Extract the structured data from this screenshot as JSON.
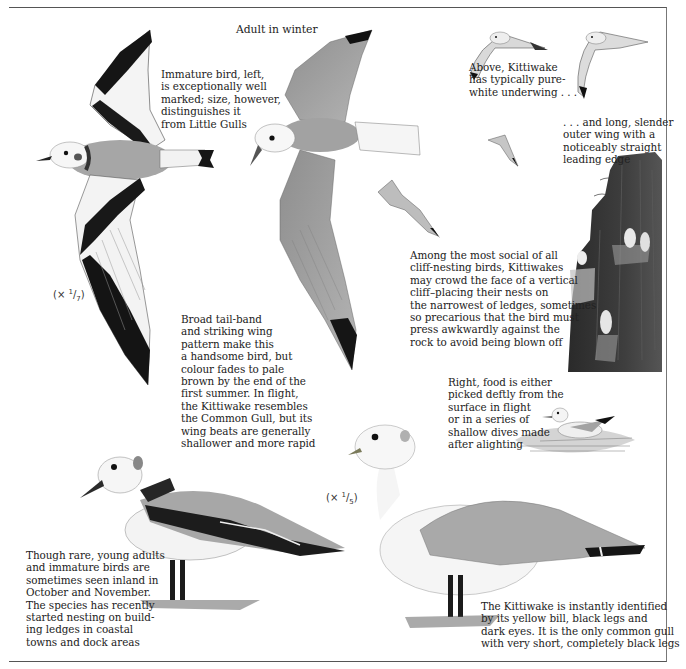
{
  "page": {
    "subject": "Kittiwake",
    "heading": "Adult in winter"
  },
  "captions": {
    "immature": "Immature bird, left,\nis exceptionally well\nmarked; size, however,\ndistinguishes it\nfrom Little Gulls",
    "underwing": "Above, Kittiwake\nhas typically pure-\nwhite underwing . . .",
    "outer_wing": ". . . and long, slender\nouter wing with a\nnoticeably straight\nleading edge",
    "cliff_nesting": "Among the most social of all\ncliff-nesting birds, Kittiwakes\nmay crowd the face of a vertical\ncliff–placing their nests on\nthe narrowest of ledges, sometimes\nso precarious that the bird must\npress awkwardly against the\nrock to avoid being blown off",
    "tail_band": "Broad tail-band\nand striking wing\npattern make this\na handsome bird, but\ncolour fades to pale\nbrown by the end of the\nfirst summer. In flight,\nthe Kittiwake resembles\nthe Common Gull, but its\nwing beats are generally\nshallower and more rapid",
    "feeding": "Right, food is either\npicked deftly from the\nsurface in flight\nor in a series of\nshallow dives made\nafter alighting",
    "young_adults": "Though rare, young adults\nand immature birds are\nsometimes seen inland in\nOctober and November.\nThe species has recently\nstarted nesting on build-\ning ledges in coastal\ntowns and dock areas",
    "identification": "The Kittiwake is instantly identified\nby its yellow bill, black legs and\ndark eyes. It is the only common gull\nwith very short, completely black legs"
  },
  "scales": {
    "flight_scale": {
      "prefix": "(× ",
      "num": "1",
      "den": "7",
      "suffix": ")"
    },
    "standing_scale": {
      "prefix": "(× ",
      "num": "1",
      "den": "5",
      "suffix": ")"
    }
  },
  "illustrations": [
    {
      "name": "immature-kittiwake-in-flight",
      "description": "Immature bird from above with black M-pattern wings and black tail-band"
    },
    {
      "name": "adult-winter-kittiwake-in-flight",
      "description": "Adult in winter from above, grey wings with black tips"
    },
    {
      "name": "kittiwake-underwing-small",
      "description": "Small flight sketch showing white underwing"
    },
    {
      "name": "kittiwake-outer-wing-small",
      "description": "Small flight sketch showing long slender outer wing"
    },
    {
      "name": "kittiwake-distant-flight",
      "description": "Small distant flying birds"
    },
    {
      "name": "kittiwakes-on-sea-cliff",
      "description": "Dark vertical cliff with nesting Kittiwakes"
    },
    {
      "name": "kittiwake-on-water",
      "description": "Kittiwake swimming on water surface"
    },
    {
      "name": "immature-kittiwake-standing",
      "description": "Immature bird standing, black collar and wing bar"
    },
    {
      "name": "adult-kittiwake-standing",
      "description": "Adult standing, grey mantle, black wing tips, black legs"
    }
  ],
  "colors": {
    "ink": "#1e1e1e",
    "wing_grey": "#9a9a9a",
    "mantle_grey": "#a8a8a8",
    "black": "#141414",
    "paper": "#ffffff"
  }
}
